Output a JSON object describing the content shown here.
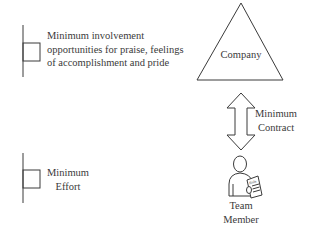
{
  "flags": [
    {
      "id": "top",
      "lines": [
        "Minimum involvement",
        "opportunities for praise, feelings",
        "of accomplishment and pride"
      ]
    },
    {
      "id": "bottom",
      "lines": [
        "Minimum",
        "Effort"
      ]
    }
  ],
  "company": {
    "label": "Company",
    "shape": "triangle"
  },
  "connector": {
    "shape": "double-arrow",
    "lines": [
      "Minimum",
      "Contract"
    ]
  },
  "team_member": {
    "icon": "person-holding-role-document-icon",
    "document_label": "Role",
    "lines": [
      "Team",
      "Member"
    ]
  },
  "colors": {
    "stroke": "#3a3a3a",
    "text": "#3a3a3a",
    "background": "#ffffff"
  }
}
